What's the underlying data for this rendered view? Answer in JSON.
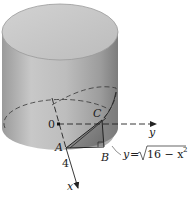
{
  "figure": {
    "labels": {
      "origin": "0",
      "y_axis": "y",
      "x_axis": "x",
      "point_a": "A",
      "point_b": "B",
      "point_c": "C",
      "radius": "4"
    },
    "equation": {
      "lhs": "y",
      "equals": "=",
      "radicand": "16 − x",
      "exponent": "2"
    },
    "colors": {
      "cylinder_top": "#c4c4c4",
      "cylinder_side_light": "#d0d0d0",
      "cylinder_side_dark": "#8a8a8a",
      "wedge": "#6e6e6e",
      "line": "#222222"
    }
  }
}
